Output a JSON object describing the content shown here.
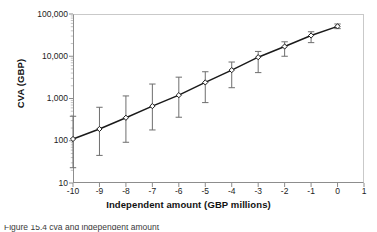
{
  "chart_data": {
    "type": "line",
    "title": "",
    "xlabel": "Independent amount (GBP millions)",
    "ylabel": "CVA (GBP)",
    "xlim": [
      -10,
      1
    ],
    "ylim": [
      10,
      100000
    ],
    "yscale": "log",
    "xscale": "linear",
    "grid": false,
    "legend": null,
    "x_ticks": [
      "-10",
      "-9",
      "-8",
      "-7",
      "-6",
      "-5",
      "-4",
      "-3",
      "-2",
      "-1",
      "0",
      "1"
    ],
    "x_tick_values": [
      -10,
      -9,
      -8,
      -7,
      -6,
      -5,
      -4,
      -3,
      -2,
      -1,
      0,
      1
    ],
    "y_ticks": [
      "10",
      "100",
      "1,000",
      "10,000",
      "100,000"
    ],
    "y_tick_values": [
      10,
      100,
      1000,
      10000,
      100000
    ],
    "marker": "diamond",
    "line_color": "#1a1a1a",
    "errorbar_color": "#6e6e6e",
    "series": [
      {
        "name": "CVA",
        "x": [
          -10,
          -9,
          -8,
          -7,
          -6,
          -5,
          -4,
          -3,
          -2,
          -1,
          0
        ],
        "values": [
          110,
          190,
          350,
          660,
          1200,
          2400,
          4700,
          9500,
          17000,
          31000,
          51000
        ],
        "err_low": [
          23,
          45,
          92,
          180,
          360,
          800,
          1800,
          4100,
          10000,
          21000,
          45000
        ],
        "err_high": [
          380,
          620,
          1150,
          2200,
          3200,
          4300,
          7300,
          13000,
          22000,
          38000,
          58000
        ]
      }
    ]
  },
  "axes": {
    "y_title": "CVA (GBP)",
    "x_title": "Independent amount (GBP millions)"
  },
  "caption": {
    "text": "Figure 15.4   cva and independent amount"
  }
}
